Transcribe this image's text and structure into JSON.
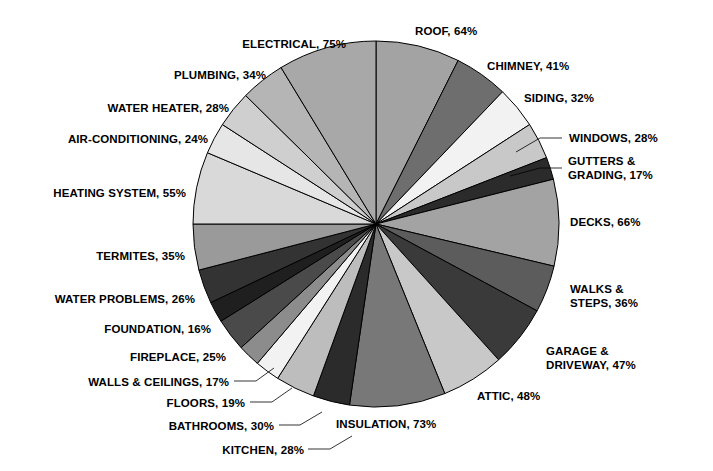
{
  "chart_data": {
    "type": "pie",
    "title": "",
    "subtitle": "",
    "xlabel": "",
    "ylabel": "",
    "legend_position": "none",
    "grid": false,
    "value_suffix": "%",
    "start_angle_deg": 0,
    "direction": "clockwise",
    "categories": [
      "ROOF",
      "CHIMNEY",
      "SIDING",
      "WINDOWS",
      "GUTTERS & GRADING",
      "DECKS",
      "WALKS & STEPS",
      "GARAGE & DRIVEWAY",
      "ATTIC",
      "INSULATION",
      "KITCHEN",
      "BATHROOMS",
      "FLOORS",
      "WALLS & CEILINGS",
      "FIREPLACE",
      "FOUNDATION",
      "WATER PROBLEMS",
      "TERMITES",
      "HEATING SYSTEM",
      "AIR-CONDITIONING",
      "WATER HEATER",
      "PLUMBING",
      "ELECTRICAL"
    ],
    "values": [
      64,
      41,
      32,
      28,
      17,
      66,
      36,
      47,
      48,
      73,
      28,
      30,
      19,
      17,
      25,
      16,
      26,
      35,
      55,
      24,
      28,
      34,
      75
    ],
    "total": 851,
    "slice_colors": [
      "#a3a3a3",
      "#6e6e6e",
      "#f2f2f2",
      "#c8c8c8",
      "#2b2b2b",
      "#a3a3a3",
      "#5c5c5c",
      "#3a3a3a",
      "#c8c8c8",
      "#787878",
      "#2b2b2b",
      "#bdbdbd",
      "#f2f2f2",
      "#8c8c8c",
      "#4a4a4a",
      "#1f1f1f",
      "#333333",
      "#9a9a9a",
      "#d9d9d9",
      "#e6e6e6",
      "#cfcfcf",
      "#b5b5b5",
      "#a8a8a8"
    ],
    "slice_stroke": "#000000",
    "background": "#ffffff",
    "labels": [
      {
        "name": "ROOF",
        "text": "ROOF, 64%",
        "align": "left",
        "x": 415,
        "y": 25,
        "leader": false
      },
      {
        "name": "CHIMNEY",
        "text": "CHIMNEY, 41%",
        "align": "left",
        "x": 487,
        "y": 60,
        "leader": false
      },
      {
        "name": "SIDING",
        "text": "SIDING, 32%",
        "align": "left",
        "x": 524,
        "y": 92,
        "leader": false
      },
      {
        "name": "WINDOWS",
        "text": "WINDOWS, 28%",
        "align": "left",
        "x": 569,
        "y": 132,
        "leader": true
      },
      {
        "name": "GUTTERS & GRADING",
        "text": "GUTTERS &\nGRADING, 17%",
        "align": "left",
        "x": 568,
        "y": 155,
        "leader": true
      },
      {
        "name": "DECKS",
        "text": "DECKS, 66%",
        "align": "left",
        "x": 570,
        "y": 216,
        "leader": false
      },
      {
        "name": "WALKS & STEPS",
        "text": "WALKS &\nSTEPS, 36%",
        "align": "left",
        "x": 570,
        "y": 283,
        "leader": false
      },
      {
        "name": "GARAGE & DRIVEWAY",
        "text": "GARAGE &\nDRIVEWAY, 47%",
        "align": "left",
        "x": 546,
        "y": 345,
        "leader": false
      },
      {
        "name": "ATTIC",
        "text": "ATTIC, 48%",
        "align": "left",
        "x": 477,
        "y": 390,
        "leader": false
      },
      {
        "name": "INSULATION",
        "text": "INSULATION, 73%",
        "align": "left",
        "x": 336,
        "y": 418,
        "leader": false
      },
      {
        "name": "KITCHEN",
        "text": "KITCHEN, 28%",
        "align": "right",
        "x": 304,
        "y": 444,
        "leader": true
      },
      {
        "name": "BATHROOMS",
        "text": "BATHROOMS, 30%",
        "align": "right",
        "x": 274,
        "y": 420,
        "leader": true
      },
      {
        "name": "FLOORS",
        "text": "FLOORS, 19%",
        "align": "right",
        "x": 245,
        "y": 397,
        "leader": true
      },
      {
        "name": "WALLS & CEILINGS",
        "text": "WALLS & CEILINGS, 17%",
        "align": "right",
        "x": 229,
        "y": 376,
        "leader": true
      },
      {
        "name": "FIREPLACE",
        "text": "FIREPLACE, 25%",
        "align": "right",
        "x": 226,
        "y": 351,
        "leader": false
      },
      {
        "name": "FOUNDATION",
        "text": "FOUNDATION, 16%",
        "align": "right",
        "x": 211,
        "y": 323,
        "leader": false
      },
      {
        "name": "WATER PROBLEMS",
        "text": "WATER PROBLEMS, 26%",
        "align": "right",
        "x": 195,
        "y": 293,
        "leader": false
      },
      {
        "name": "TERMITES",
        "text": "TERMITES, 35%",
        "align": "right",
        "x": 185,
        "y": 250,
        "leader": false
      },
      {
        "name": "HEATING SYSTEM",
        "text": "HEATING SYSTEM, 55%",
        "align": "right",
        "x": 186,
        "y": 187,
        "leader": false
      },
      {
        "name": "AIR-CONDITIONING",
        "text": "AIR-CONDITIONING, 24%",
        "align": "right",
        "x": 208,
        "y": 133,
        "leader": false
      },
      {
        "name": "WATER HEATER",
        "text": "WATER HEATER, 28%",
        "align": "right",
        "x": 229,
        "y": 102,
        "leader": false
      },
      {
        "name": "PLUMBING",
        "text": "PLUMBING, 34%",
        "align": "right",
        "x": 266,
        "y": 69,
        "leader": false
      },
      {
        "name": "ELECTRICAL",
        "text": "ELECTRICAL, 75%",
        "align": "right",
        "x": 346,
        "y": 38,
        "leader": false
      }
    ],
    "geometry": {
      "cx": 376,
      "cy": 224,
      "r": 183
    }
  }
}
